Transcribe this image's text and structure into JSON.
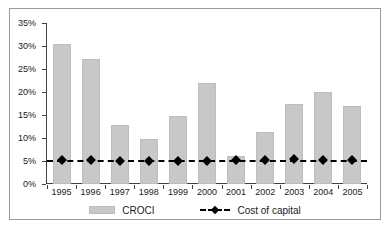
{
  "chart_data": {
    "type": "bar",
    "title": "",
    "xlabel": "",
    "ylabel": "",
    "categories": [
      "1995",
      "1996",
      "1997",
      "1998",
      "1999",
      "2000",
      "2001",
      "2002",
      "2003",
      "2004",
      "2005"
    ],
    "ylim": [
      0,
      35
    ],
    "ytick_labels": [
      "0%",
      "5%",
      "10%",
      "15%",
      "20%",
      "25%",
      "30%",
      "35%"
    ],
    "ytick_values": [
      0,
      5,
      10,
      15,
      20,
      25,
      30,
      35
    ],
    "grid": false,
    "legend_position": "bottom",
    "series": [
      {
        "name": "CROCI",
        "type": "bar",
        "color": "#c8c8c8",
        "values": [
          30.5,
          27.2,
          12.9,
          9.7,
          14.8,
          21.9,
          6.1,
          11.4,
          17.3,
          20.0,
          17.0
        ]
      },
      {
        "name": "Cost of capital",
        "type": "line",
        "color": "#000000",
        "values": [
          5.3,
          5.2,
          5.1,
          5.0,
          4.9,
          4.9,
          5.2,
          5.3,
          5.4,
          5.3,
          5.3
        ]
      }
    ]
  },
  "legend": {
    "croci_label": "CROCI",
    "cost_of_capital_label": "Cost of capital"
  }
}
